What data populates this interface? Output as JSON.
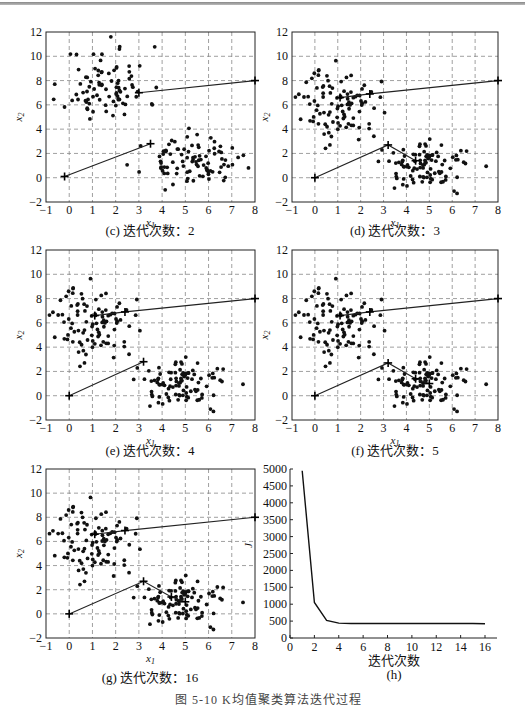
{
  "figure_caption": "图 5-10  K均值聚类算法迭代过程",
  "chart_data": [
    {
      "id": "c",
      "type": "scatter",
      "title": "(c) 迭代次数：2",
      "xlabel": "x1",
      "ylabel": "x2",
      "xlim": [
        -1,
        8
      ],
      "ylim": [
        -2,
        12
      ],
      "xticks": [
        -1,
        0,
        1,
        2,
        3,
        4,
        5,
        6,
        7,
        8
      ],
      "yticks": [
        -2,
        0,
        2,
        4,
        6,
        8,
        10,
        12
      ],
      "grid": true,
      "centroid_paths": [
        [
          [
            8,
            8
          ],
          [
            3.0,
            7.0
          ]
        ],
        [
          [
            -0.2,
            0.1
          ],
          [
            3.5,
            2.8
          ]
        ]
      ],
      "clusters": [
        {
          "center": [
            1.6,
            7.6
          ],
          "spread": [
            0.9,
            1.6
          ],
          "n": 85,
          "seed": 11
        },
        {
          "center": [
            5.2,
            1.3
          ],
          "spread": [
            1.0,
            0.9
          ],
          "n": 90,
          "seed": 23
        }
      ]
    },
    {
      "id": "d",
      "type": "scatter",
      "title": "(d) 迭代次数：3",
      "xlabel": "x1",
      "ylabel": "x2",
      "xlim": [
        -1,
        8
      ],
      "ylim": [
        -2,
        12
      ],
      "xticks": [
        -1,
        0,
        1,
        2,
        3,
        4,
        5,
        6,
        7,
        8
      ],
      "yticks": [
        -2,
        0,
        2,
        4,
        6,
        8,
        10,
        12
      ],
      "grid": true,
      "centroid_paths": [
        [
          [
            8,
            8
          ],
          [
            2.4,
            6.9
          ],
          [
            1.1,
            6.6
          ]
        ],
        [
          [
            0,
            0
          ],
          [
            3.2,
            2.7
          ],
          [
            4.4,
            1.4
          ]
        ]
      ],
      "clusters": [
        {
          "center": [
            1.1,
            6.0
          ],
          "spread": [
            0.85,
            1.5
          ],
          "n": 95,
          "seed": 37
        },
        {
          "center": [
            5.0,
            1.0
          ],
          "spread": [
            0.95,
            0.9
          ],
          "n": 95,
          "seed": 41
        }
      ]
    },
    {
      "id": "e",
      "type": "scatter",
      "title": "(e) 迭代次数：4",
      "xlabel": "x1",
      "ylabel": "x2",
      "xlim": [
        -1,
        8
      ],
      "ylim": [
        -2,
        12
      ],
      "xticks": [
        -1,
        0,
        1,
        2,
        3,
        4,
        5,
        6,
        7,
        8
      ],
      "yticks": [
        -2,
        0,
        2,
        4,
        6,
        8,
        10,
        12
      ],
      "grid": true,
      "centroid_paths": [
        [
          [
            8,
            8
          ],
          [
            2.4,
            6.9
          ],
          [
            1.1,
            6.6
          ]
        ],
        [
          [
            0,
            0
          ],
          [
            3.2,
            2.8
          ]
        ]
      ],
      "clusters": [
        {
          "center": [
            1.1,
            6.0
          ],
          "spread": [
            0.85,
            1.5
          ],
          "n": 95,
          "seed": 37
        },
        {
          "center": [
            5.0,
            1.0
          ],
          "spread": [
            0.95,
            0.9
          ],
          "n": 95,
          "seed": 41
        }
      ]
    },
    {
      "id": "f",
      "type": "scatter",
      "title": "(f) 迭代次数：5",
      "xlabel": "x1",
      "ylabel": "x2",
      "xlim": [
        -1,
        8
      ],
      "ylim": [
        -2,
        12
      ],
      "xticks": [
        -1,
        0,
        1,
        2,
        3,
        4,
        5,
        6,
        7,
        8
      ],
      "yticks": [
        -2,
        0,
        2,
        4,
        6,
        8,
        10,
        12
      ],
      "grid": true,
      "centroid_paths": [
        [
          [
            8,
            8
          ],
          [
            2.4,
            6.9
          ],
          [
            1.1,
            6.6
          ]
        ],
        [
          [
            0,
            0
          ],
          [
            3.2,
            2.7
          ],
          [
            4.4,
            1.4
          ],
          [
            5.0,
            1.0
          ]
        ]
      ],
      "clusters": [
        {
          "center": [
            1.1,
            6.0
          ],
          "spread": [
            0.85,
            1.5
          ],
          "n": 95,
          "seed": 37
        },
        {
          "center": [
            5.0,
            1.0
          ],
          "spread": [
            0.95,
            0.9
          ],
          "n": 95,
          "seed": 41
        }
      ]
    },
    {
      "id": "g",
      "type": "scatter",
      "title": "(g) 迭代次数：16",
      "xlabel": "x1",
      "ylabel": "x2",
      "xlim": [
        -1,
        8
      ],
      "ylim": [
        -2,
        12
      ],
      "xticks": [
        -1,
        0,
        1,
        2,
        3,
        4,
        5,
        6,
        7,
        8
      ],
      "yticks": [
        -2,
        0,
        2,
        4,
        6,
        8,
        10,
        12
      ],
      "grid": true,
      "centroid_paths": [
        [
          [
            8,
            8
          ],
          [
            2.4,
            6.9
          ],
          [
            1.1,
            6.6
          ]
        ],
        [
          [
            0,
            0
          ],
          [
            3.2,
            2.7
          ],
          [
            4.4,
            1.4
          ],
          [
            5.0,
            1.0
          ]
        ]
      ],
      "clusters": [
        {
          "center": [
            1.1,
            6.0
          ],
          "spread": [
            0.85,
            1.5
          ],
          "n": 95,
          "seed": 37
        },
        {
          "center": [
            5.0,
            1.0
          ],
          "spread": [
            0.95,
            0.9
          ],
          "n": 95,
          "seed": 41
        }
      ]
    },
    {
      "id": "h",
      "type": "line",
      "title": "(h)",
      "xlabel": "迭代次数",
      "ylabel": "J",
      "xlim": [
        0,
        17
      ],
      "ylim": [
        0,
        5000
      ],
      "xticks": [
        0,
        2,
        4,
        6,
        8,
        10,
        12,
        14,
        16
      ],
      "yticks": [
        0,
        500,
        1000,
        1500,
        2000,
        2500,
        3000,
        3500,
        4000,
        4500,
        5000
      ],
      "grid": false,
      "x": [
        1,
        2,
        3,
        4,
        5,
        6,
        7,
        8,
        9,
        10,
        11,
        12,
        13,
        14,
        15,
        16
      ],
      "values": [
        4950,
        1050,
        520,
        440,
        430,
        430,
        430,
        430,
        430,
        430,
        430,
        430,
        430,
        430,
        430,
        420
      ]
    }
  ],
  "captions": {
    "c": "(c) 迭代次数：2",
    "d": "(d) 迭代次数：3",
    "e": "(e) 迭代次数：4",
    "f": "(f) 迭代次数：5",
    "g": "(g) 迭代次数：16",
    "h_xlabel": "迭代次数",
    "h": "(h)"
  }
}
